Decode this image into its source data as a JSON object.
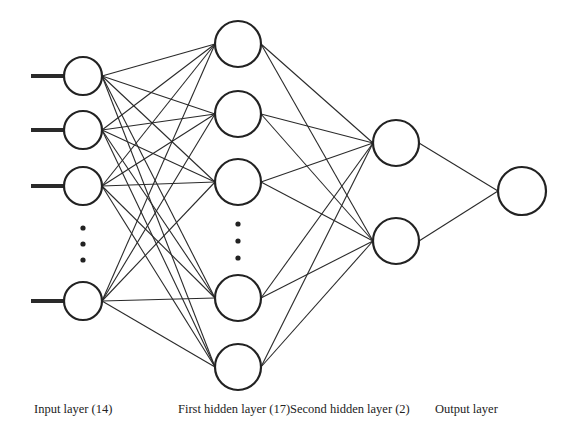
{
  "diagram": {
    "colors": {
      "stroke": "#222222",
      "background": "#ffffff"
    },
    "layers": [
      {
        "id": "input",
        "label": "Input layer (14)",
        "units": 14,
        "label_x": 34,
        "x": 83,
        "radius": 19,
        "nodes_y": [
          76,
          130,
          186,
          301
        ],
        "ellipsis_y": [
          228,
          244,
          260
        ],
        "has_input_stubs": true
      },
      {
        "id": "hidden1",
        "label": "First hidden layer (17)",
        "units": 17,
        "label_x": 178,
        "x": 238,
        "radius": 23,
        "nodes_y": [
          44,
          114,
          182,
          298,
          367
        ],
        "ellipsis_y": [
          224,
          241,
          258
        ]
      },
      {
        "id": "hidden2",
        "label": "Second hidden layer (2)",
        "units": 2,
        "label_x": 290,
        "x": 396,
        "radius": 23,
        "nodes_y": [
          143,
          241
        ],
        "ellipsis_y": []
      },
      {
        "id": "output",
        "label": "Output layer",
        "units": 1,
        "label_x": 435,
        "x": 522,
        "radius": 24,
        "nodes_y": [
          191
        ],
        "ellipsis_y": []
      }
    ],
    "input_stub_start_x": 31,
    "connectivity": "fully-connected"
  }
}
